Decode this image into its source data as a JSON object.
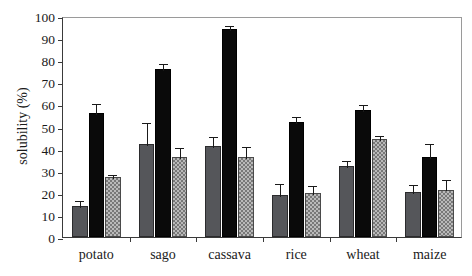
{
  "chart_data": {
    "type": "bar",
    "title": "",
    "xlabel": "",
    "ylabel": "solubility (%)",
    "ylim": [
      0,
      100
    ],
    "yticks": [
      0,
      10,
      20,
      30,
      40,
      50,
      60,
      70,
      80,
      90,
      100
    ],
    "ytick_labels": [
      "0",
      "10",
      "20",
      "30",
      "40",
      "50",
      "60",
      "70",
      "80",
      "90",
      "100"
    ],
    "grid": false,
    "legend": "none",
    "categories": [
      "potato",
      "sago",
      "cassava",
      "rice",
      "wheat",
      "maize"
    ],
    "series": [
      {
        "name": "series-1",
        "fill": "dark-gray-solid",
        "color": "#55565a",
        "values": [
          14,
          42,
          41,
          19,
          32,
          20.5
        ],
        "errors": [
          3,
          10.5,
          5,
          6,
          3.5,
          4
        ]
      },
      {
        "name": "series-2",
        "fill": "black-solid",
        "color": "#0a0a0a",
        "values": [
          56,
          76,
          94,
          52,
          57.5,
          36
        ],
        "errors": [
          5,
          3,
          2.5,
          3,
          3,
          7
        ]
      },
      {
        "name": "series-3",
        "fill": "light-gray-checkered",
        "color": "#b9b9b9",
        "values": [
          27,
          36,
          36,
          20,
          44.5,
          21.5
        ],
        "errors": [
          2,
          5,
          5.5,
          4,
          2,
          5
        ]
      }
    ]
  },
  "axis": {
    "y_title": "solubility (%)"
  }
}
